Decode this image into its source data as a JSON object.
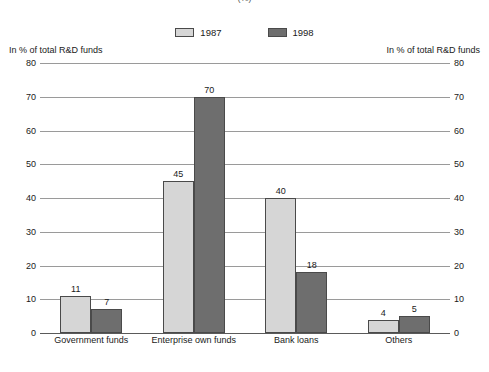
{
  "chart_data": {
    "type": "bar",
    "title": "(%)",
    "xlabel": "",
    "ylabel": "In % of total R&D funds",
    "ylabel_right": "In % of total R&D funds",
    "ylim": [
      0,
      80
    ],
    "yticks": [
      80,
      70,
      60,
      50,
      40,
      30,
      20,
      10,
      0
    ],
    "ytick_labels": [
      "80",
      "70",
      "60",
      "50",
      "40",
      "30",
      "20",
      "10",
      "0"
    ],
    "grid": true,
    "legend_position": "top-center",
    "categories": [
      "Government funds",
      "Enterprise own funds",
      "Bank loans",
      "Others"
    ],
    "series": [
      {
        "name": "1987",
        "color": "#d6d6d6",
        "values": [
          11,
          45,
          40,
          4
        ],
        "labels": [
          "11",
          "45",
          "40",
          "4"
        ]
      },
      {
        "name": "1998",
        "color": "#6e6e6e",
        "values": [
          7,
          70,
          18,
          5
        ],
        "labels": [
          "7",
          "70",
          "18",
          "5"
        ]
      }
    ]
  }
}
